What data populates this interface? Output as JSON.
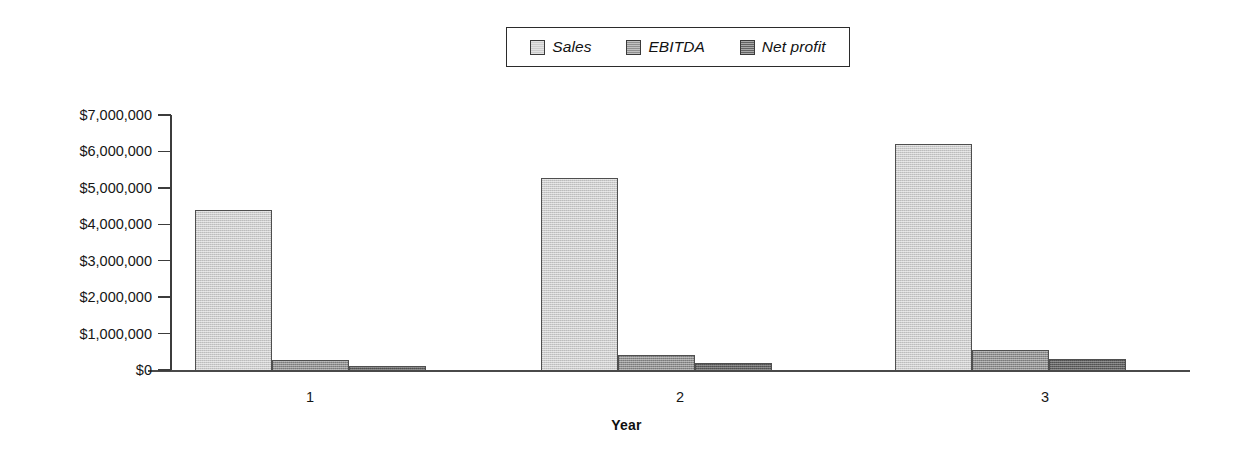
{
  "chart_data": {
    "type": "bar",
    "title": "",
    "xlabel": "Year",
    "ylabel": "",
    "categories": [
      "1",
      "2",
      "3"
    ],
    "series": [
      {
        "name": "Sales",
        "values": [
          4400000,
          5280000,
          6200000
        ],
        "color": "#cccccc"
      },
      {
        "name": "EBITDA",
        "values": [
          280000,
          420000,
          560000
        ],
        "color": "#8f8f8f"
      },
      {
        "name": "Net profit",
        "values": [
          120000,
          200000,
          290000
        ],
        "color": "#626262"
      }
    ],
    "ylim": [
      0,
      7000000
    ],
    "ytick_values": [
      0,
      1000000,
      2000000,
      3000000,
      4000000,
      5000000,
      6000000,
      7000000
    ],
    "ytick_labels": [
      "$0",
      "$1,000,000",
      "$2,000,000",
      "$3,000,000",
      "$4,000,000",
      "$5,000,000",
      "$6,000,000",
      "$7,000,000"
    ],
    "grid": false,
    "legend_position": "top-center",
    "legend_italic": true
  },
  "legend": {
    "entries": [
      {
        "label": "Sales",
        "swatch_color": "#cccccc"
      },
      {
        "label": "EBITDA",
        "swatch_color": "#8f8f8f"
      },
      {
        "label": "Net profit",
        "swatch_color": "#626262"
      }
    ]
  },
  "axes": {
    "x_title": "Year",
    "category_labels": [
      "1",
      "2",
      "3"
    ]
  },
  "geometry": {
    "plot_left": 171,
    "plot_right": 1190,
    "baseline_y": 370,
    "top_y": 115,
    "value_max": 7000000,
    "group_starts": [
      195,
      541,
      895
    ],
    "bar_width": 77,
    "group_label_x": [
      310,
      680,
      1045
    ]
  }
}
